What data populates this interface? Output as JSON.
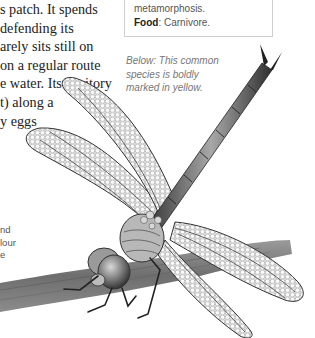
{
  "body_text": {
    "lines": [
      "s patch. It spends",
      "defending its",
      "arely sits still on",
      "on a regular route",
      "e water. Its territory",
      "t) along a",
      "y eggs"
    ]
  },
  "info_box": {
    "line1": "metamorphosis.",
    "food_label": "Food",
    "food_value": ": Carnivore."
  },
  "caption": {
    "lines": [
      "Below: This common",
      "species is boldly",
      "marked in yellow."
    ]
  },
  "side_text": {
    "lines": [
      "nd",
      "lour",
      "e"
    ]
  },
  "illustration": {
    "subject": "dragonfly-on-twig",
    "style": "grayscale pencil"
  }
}
